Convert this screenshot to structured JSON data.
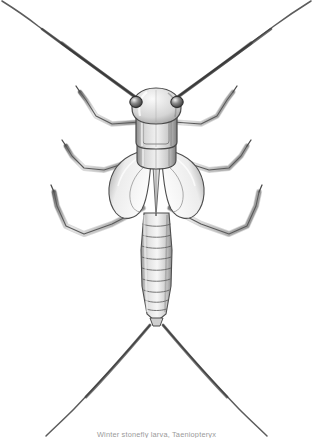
{
  "plate": {
    "background_color": "#ffffff",
    "ink_color": "#4a4a4a",
    "shadow_color": "#8d8d8d",
    "medium": "graphite pencil drawing",
    "view": "dorsal",
    "width": 313,
    "height": 438
  },
  "caption": {
    "text": "Winter stonefly larva, Taeniopteryx",
    "common_name": "Winter stonefly larva",
    "genus": "Taeniopteryx",
    "color": "#9a9a9a"
  },
  "subject": {
    "name": "winter-stonefly-nymph",
    "parts": [
      {
        "key": "left-antenna",
        "label": "Left antenna"
      },
      {
        "key": "right-antenna",
        "label": "Right antenna"
      },
      {
        "key": "head",
        "label": "Head"
      },
      {
        "key": "left-eye",
        "label": "Left compound eye"
      },
      {
        "key": "right-eye",
        "label": "Right compound eye"
      },
      {
        "key": "pronotum",
        "label": "Pronotum"
      },
      {
        "key": "mesonotum",
        "label": "Mesonotum"
      },
      {
        "key": "wing-pads",
        "label": "Wing pads"
      },
      {
        "key": "abdomen",
        "label": "Segmented abdomen"
      },
      {
        "key": "left-cercus",
        "label": "Left cercus"
      },
      {
        "key": "right-cercus",
        "label": "Right cercus"
      },
      {
        "key": "legs",
        "label": "Three pairs of legs"
      }
    ],
    "abdomen_segments": 10,
    "leg_pairs": 3,
    "cerci_count": 2,
    "antennae_count": 2
  }
}
